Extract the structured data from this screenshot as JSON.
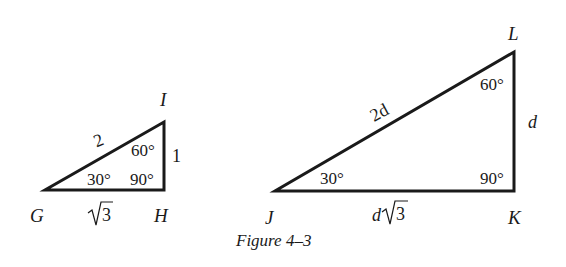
{
  "figure": {
    "caption": "Figure 4–3",
    "triangles": [
      {
        "id": "GHI",
        "vertices": {
          "G": {
            "label": "G",
            "angle": "30°"
          },
          "H": {
            "label": "H",
            "angle": "90°"
          },
          "I": {
            "label": "I",
            "angle": "60°"
          }
        },
        "sides": {
          "hypotenuse_GI": "2",
          "short_leg_HI": "1",
          "long_leg_GH_radicand": "3"
        }
      },
      {
        "id": "JKL",
        "vertices": {
          "J": {
            "label": "J",
            "angle": "30°"
          },
          "K": {
            "label": "K",
            "angle": "90°"
          },
          "L": {
            "label": "L",
            "angle": "60°"
          }
        },
        "sides": {
          "hypotenuse_JL": "2d",
          "short_leg_KL": "d",
          "long_leg_JK_coefficient": "d",
          "long_leg_JK_radicand": "3"
        }
      }
    ]
  }
}
